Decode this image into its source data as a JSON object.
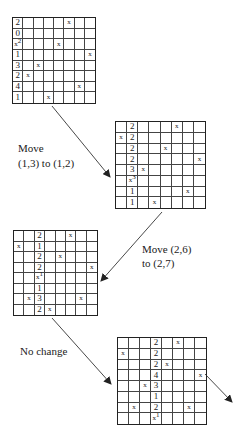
{
  "grids": [
    {
      "id": "grid-1",
      "box": {
        "left": 12,
        "top": 17,
        "width": 84,
        "height": 87
      },
      "rows": [
        [
          "2",
          "",
          "",
          "",
          "",
          "x",
          "",
          ""
        ],
        [
          "0",
          "",
          "",
          "",
          "",
          "",
          "",
          ""
        ],
        [
          "x2",
          "",
          "",
          "",
          "x",
          "",
          "",
          ""
        ],
        [
          "1",
          "",
          "",
          "",
          "",
          "",
          "",
          "x"
        ],
        [
          "3",
          "",
          "x",
          "",
          "",
          "",
          "",
          ""
        ],
        [
          "2",
          "x",
          "",
          "",
          "",
          "",
          "",
          ""
        ],
        [
          "4",
          "",
          "",
          "",
          "",
          "",
          "x",
          ""
        ],
        [
          "1",
          "",
          "",
          "x",
          "",
          "",
          "",
          ""
        ]
      ]
    },
    {
      "id": "grid-2",
      "box": {
        "left": 115,
        "top": 121,
        "width": 91,
        "height": 88
      },
      "rows": [
        [
          "",
          "2",
          "",
          "",
          "",
          "x",
          "",
          ""
        ],
        [
          "x",
          "2",
          "",
          "",
          "",
          "",
          "",
          ""
        ],
        [
          "",
          "2",
          "",
          "",
          "x",
          "",
          "",
          ""
        ],
        [
          "",
          "2",
          "",
          "",
          "",
          "",
          "",
          "x"
        ],
        [
          "",
          "3",
          "x",
          "",
          "",
          "",
          "",
          ""
        ],
        [
          "",
          "x3",
          "",
          "",
          "",
          "",
          "",
          ""
        ],
        [
          "",
          "1",
          "",
          "",
          "",
          "",
          "x",
          ""
        ],
        [
          "",
          "1",
          "",
          "x",
          "",
          "",
          "",
          ""
        ]
      ]
    },
    {
      "id": "grid-3",
      "box": {
        "left": 13,
        "top": 230,
        "width": 85,
        "height": 86
      },
      "rows": [
        [
          "",
          "",
          "2",
          "",
          "",
          "x",
          "",
          ""
        ],
        [
          "x",
          "",
          "1",
          "",
          "",
          "",
          "",
          ""
        ],
        [
          "",
          "",
          "2",
          "",
          "x",
          "",
          "",
          ""
        ],
        [
          "",
          "",
          "2",
          "",
          "",
          "",
          "",
          "x"
        ],
        [
          "",
          "",
          "x1",
          "",
          "",
          "",
          "",
          ""
        ],
        [
          "",
          "",
          "1",
          "",
          "",
          "",
          "",
          ""
        ],
        [
          "",
          "x",
          "3",
          "",
          "",
          "",
          "x",
          ""
        ],
        [
          "",
          "",
          "2",
          "x",
          "",
          "",
          "",
          ""
        ]
      ]
    },
    {
      "id": "grid-4",
      "box": {
        "left": 117,
        "top": 337,
        "width": 90,
        "height": 88
      },
      "rows": [
        [
          "",
          "",
          "",
          "2",
          "",
          "x",
          "",
          ""
        ],
        [
          "x",
          "",
          "",
          "2",
          "",
          "",
          "",
          ""
        ],
        [
          "",
          "",
          "",
          "2",
          "x",
          "",
          "",
          ""
        ],
        [
          "",
          "",
          "",
          "4",
          "",
          "",
          "",
          "x"
        ],
        [
          "",
          "",
          "x",
          "3",
          "",
          "",
          "",
          ""
        ],
        [
          "",
          "",
          "",
          "1",
          "",
          "",
          "",
          ""
        ],
        [
          "",
          "x",
          "",
          "2",
          "",
          "",
          "x",
          ""
        ],
        [
          "",
          "",
          "",
          "x1",
          "",
          "",
          "",
          ""
        ]
      ]
    }
  ],
  "labels": {
    "step1_line1": "Move",
    "step1_line2": "(1,3) to (1,2)",
    "step2_line1": "Move (2,6)",
    "step2_line2": "to (2,7)",
    "step3": "No change"
  },
  "arrows": [
    {
      "x1": 52,
      "y1": 106,
      "x2": 110,
      "y2": 177
    },
    {
      "x1": 162,
      "y1": 212,
      "x2": 101,
      "y2": 281
    },
    {
      "x1": 52,
      "y1": 318,
      "x2": 111,
      "y2": 384
    },
    {
      "x1": 205,
      "y1": 374,
      "x2": 232,
      "y2": 402
    }
  ],
  "colors": {
    "ink": "#222222",
    "background": "#ffffff"
  }
}
